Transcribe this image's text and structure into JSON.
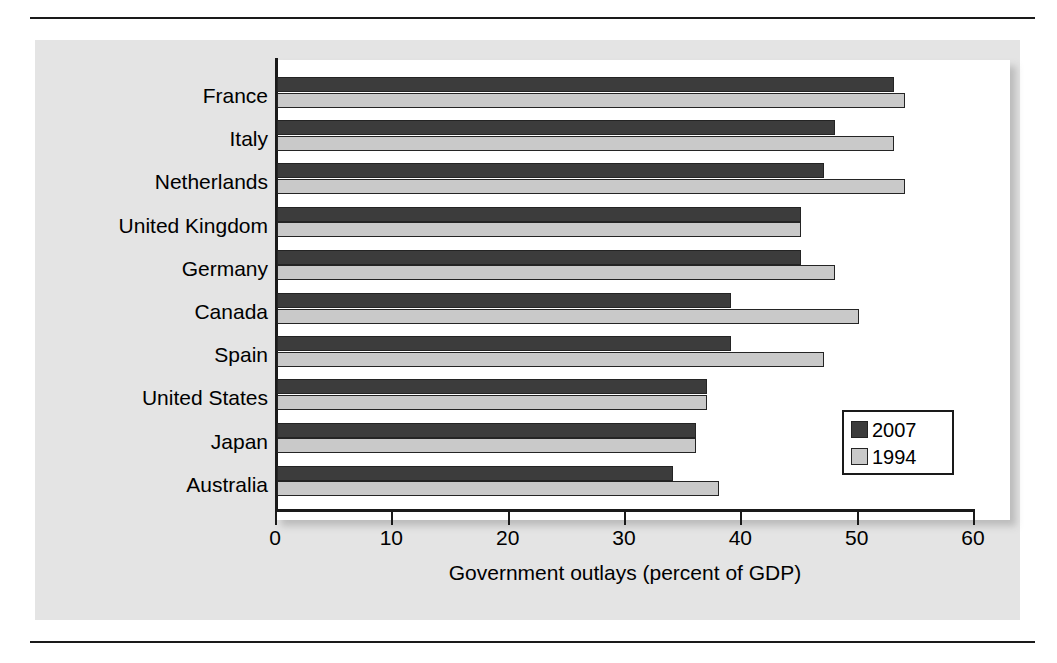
{
  "chart_data": {
    "type": "bar",
    "orientation": "horizontal",
    "title": "",
    "xlabel": "Government outlays (percent of GDP)",
    "ylabel": "",
    "xlim": [
      0,
      60
    ],
    "xticks": [
      0,
      10,
      20,
      30,
      40,
      50,
      60
    ],
    "xtick_labels": [
      "0",
      "10",
      "20",
      "30",
      "40",
      "50",
      "60"
    ],
    "grid": false,
    "legend_position": "lower-right",
    "categories": [
      "France",
      "Italy",
      "Netherlands",
      "United Kingdom",
      "Germany",
      "Canada",
      "Spain",
      "United States",
      "Japan",
      "Australia"
    ],
    "series": [
      {
        "name": "2007",
        "color": "#3c3c3c",
        "values": [
          53,
          48,
          47,
          45,
          45,
          39,
          39,
          37,
          36,
          34
        ]
      },
      {
        "name": "1994",
        "color": "#c9c9c9",
        "values": [
          54,
          53,
          54,
          45,
          48,
          50,
          47,
          37,
          36,
          38
        ]
      }
    ]
  },
  "legend": {
    "entries": [
      {
        "label": "2007",
        "swatch": "dark-swatch"
      },
      {
        "label": "1994",
        "swatch": "light-swatch"
      }
    ]
  }
}
